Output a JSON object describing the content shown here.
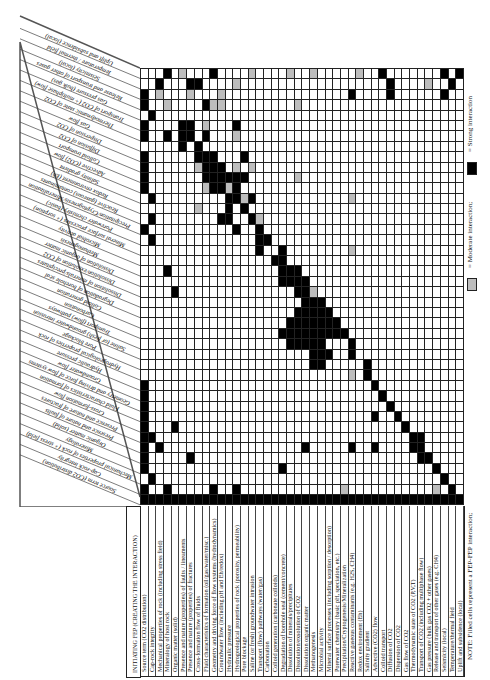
{
  "matrix": {
    "row_header": "INITIATING FEP (CREATING THE INTERACTION)",
    "col_header": "SOURCE TERM (CO2 DISTRIBUTION)",
    "rows": [
      "Source term (CO2 distribution)",
      "Cap-rock integrity",
      "Mechanical properties of rock (including stress field)",
      "Mineralogy of host rock",
      "Organic matter (solid)",
      "Presence and nature (properties) of faults / lineaments",
      "Presence and nature (properties) of fractures",
      "Cross-formation flow of fluids",
      "Fluid characteristics of formation (oil/gas/water/misc.)",
      "Geometry and driving force of flow systems (hydrodynamics)",
      "Groundwater flow (including pH and Eh/redox)",
      "Hydraulic pressure",
      "Hydrogeological properties of rock (porosity, permeability)",
      "Pore blockage",
      "Saline (or fresh) groundwater intrusion",
      "Transport (flow) pathways (water/gas)",
      "Carbonation",
      "Colloid generation (carbonate colloids)",
      "Degradation of borehole seal (cement/concrete)",
      "Dissolution of minerals/precipitates",
      "Dissolution/exsolution of CO2",
      "Dissolution organic matter",
      "Methanogenesis",
      "Microbial activity",
      "Mineral surface processes (including sorption / desorption)",
      "Porewater chemistry (basic pH, speciation, etc.)",
      "Precipitation/Cryptogenesis/Mineralization",
      "Reactive gaseous contaminants (e.g. H2S, CH4)",
      "Redox environment (Eh)",
      "Salinity gradient",
      "Advective (CO2) flow",
      "Colloid transport",
      "Diffusion of CO2",
      "Dispersion of CO2",
      "Gas flow of CO2",
      "Thermodynamic state of CO2 (P,V,T)",
      "Transport of CO2 (including multiphase flow)",
      "Gas pressure (bulk gas CO2 + other gases)",
      "Release and transport of other gases (e.g. CH4)",
      "Seismicity (local)",
      "Temperature/thermal field",
      "Uplift and subsidence (local)"
    ],
    "columns": [
      "Source term (CO2 distribution)",
      "Cap-rock integrity",
      "Mechanical properties of rock (+ stress field)",
      "Mineralogy",
      "Organic matter (solid)",
      "Presence and nature of faults",
      "Presence and nature of fractures",
      "Cross-formation flow",
      "Fluid characteristics of formation",
      "Geometry and driving force of flow systems",
      "Groundwater flow",
      "Hydraulic pressure",
      "Hydrogeological properties of rock",
      "Pore blockage",
      "Saline (or fresh) groundwater intrusion",
      "Transport (flow) pathways",
      "Carbonation",
      "Colloid generation",
      "Degradation of borehole seal",
      "Dissolution of minerals/precipitates",
      "Dissolution/exsolution of CO2",
      "Dissolution of organic matter",
      "Methanogenesis",
      "Microbial activity",
      "Mineral surface processes (+ sorption)",
      "Porewater chemistry (basic)",
      "Precipitation/Cryptogenesis/Mineralization",
      "Reactive (gaseous) contaminants",
      "Redox environment (Eh)",
      "Salinity gradient",
      "Advective (CO2) flow",
      "Colloid transport",
      "Diffusion of CO2",
      "Dispersion of CO2",
      "Gas flow",
      "Thermodynamic state of CO2",
      "Transport of CO2 (+ multiphase flow)",
      "Gas pressure (bulk gas)",
      "Release and transport of other gases",
      "Seismicity (local)",
      "Temperature / thermal field",
      "Uplift and subsidence (local)"
    ],
    "cells_legend": {
      "0": "none",
      "1": "moderate",
      "2": "strong"
    },
    "cells": [
      "000201000200001000010010000010020000000202",
      "002000220000100000000000000000002000010020",
      "201000100010000000000000000200002000000200",
      "200100002110000000001000000000000000000000",
      "020000000000000000000000000000000000000000",
      "200002201000200000000000000000000000000000",
      "200202202000100000000000000000000000000000",
      "000002020000000000000000000000000000000000",
      "200000022200020000000000000000000000000000",
      "200000012220101000000000000000000000000000",
      "200000002222220000001000000000000000000000",
      "200000001221200000000000000000000000000000",
      "020000000002212000000000000100000000000000",
      "000000010002020000000000000000000000000000",
      "020000000022002100000000000000000000000000",
      "200000000000200200000000000000000000000000",
      "020000000000000220000000000000000000000000",
      "000000000000000200200000000100000000000000",
      "000000000000000002200000000000000000000000",
      "000200000000000000222000000000000000000000",
      "000000000000000000222200000000000000000000",
      "000020000000000000002210000000000000000000",
      "000000000000000000000222000000000000000000",
      "000000000000000000002222200000000000000000",
      "000000000000000000022222220000000000000000",
      "000000000000000000222222222000000000000000",
      "000000000000000000022222000200000000000000",
      "000000000000000000000022200200000000000000",
      "000000000000000000000022000002000000000000",
      "000000000000000000000000000102000000000000",
      "200000000000000000000000000000200000000000",
      "200000000000000000000000000000020000000000",
      "200000000000000000000000000000002000000000",
      "200000000000000000000000000000200200000000",
      "200020000000000000000000000000000020000000",
      "220000000000000000000000000000000002200000",
      "202000000000000000000200000200200002200000",
      "200000200000000000000000000000000000220000",
      "200000000000000000200000000000000000002000",
      "020000000000000000000000000000000000000200",
      "200200000200200000000000001000000000001020",
      "222222222222222222222222222222222222222222"
    ]
  },
  "legend": {
    "note": "NOTE: Filled cells represent a FEP-FEP interaction;",
    "moderate_label": "= Moderate interaction;",
    "strong_label": "= Strong interaction",
    "moderate_color": "#bdbdbd",
    "strong_color": "#000000"
  }
}
